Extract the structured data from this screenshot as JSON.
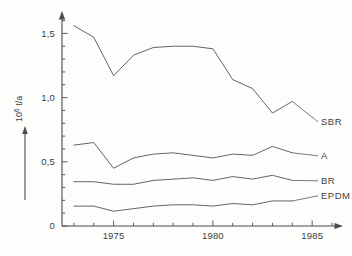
{
  "chart_data": {
    "type": "line",
    "title": "",
    "xlabel": "",
    "ylabel": "10⁶ t/a",
    "ylabel_base": "10",
    "ylabel_exponent": "6",
    "ylabel_unit": " t/a",
    "xlim": [
      1972.4,
      1986.2
    ],
    "ylim": [
      0,
      1.62
    ],
    "grid": false,
    "legend_position": "right-inline",
    "decimal_separator": ",",
    "x_tick_labels": [
      "1975",
      "1980",
      "1985"
    ],
    "x_tick_values": [
      1975,
      1980,
      1985
    ],
    "x_minor_ticks": [
      1973,
      1974,
      1976,
      1977,
      1978,
      1979,
      1981,
      1982,
      1983,
      1984,
      1986
    ],
    "y_tick_labels": [
      "0",
      "0,5",
      "1,0",
      "1,5"
    ],
    "y_tick_values": [
      0,
      0.5,
      1.0,
      1.5
    ],
    "y_minor_ticks": [
      0.1,
      0.2,
      0.3,
      0.4,
      0.6,
      0.7,
      0.8,
      0.9,
      1.1,
      1.2,
      1.3,
      1.4,
      1.6
    ],
    "x": [
      1973,
      1974,
      1975,
      1976,
      1977,
      1978,
      1979,
      1980,
      1981,
      1982,
      1983,
      1984
    ],
    "series": [
      {
        "name": "SBR",
        "label": "SBR",
        "color": "#5c5c5c",
        "values": [
          1.56,
          1.47,
          1.17,
          1.33,
          1.39,
          1.4,
          1.4,
          1.38,
          1.14,
          1.07,
          0.88,
          0.97
        ]
      },
      {
        "name": "A",
        "label": "A",
        "color": "#5c5c5c",
        "values": [
          0.63,
          0.65,
          0.45,
          0.53,
          0.56,
          0.57,
          0.55,
          0.53,
          0.56,
          0.55,
          0.62,
          0.57
        ]
      },
      {
        "name": "BR",
        "label": "BR",
        "color": "#5c5c5c",
        "values": [
          0.345,
          0.345,
          0.325,
          0.325,
          0.355,
          0.365,
          0.375,
          0.355,
          0.385,
          0.365,
          0.395,
          0.355
        ]
      },
      {
        "name": "EPDM",
        "label": "EPDM",
        "color": "#5c5c5c",
        "values": [
          0.155,
          0.155,
          0.115,
          0.135,
          0.155,
          0.165,
          0.165,
          0.155,
          0.175,
          0.165,
          0.195,
          0.195
        ]
      }
    ]
  },
  "axes": {
    "y_axis_name": "y-axis",
    "x_axis_name": "x-axis",
    "y_arrow": "up-arrow",
    "x_arrow": "right-arrow",
    "ylabel_arrow": "up-arrow"
  }
}
